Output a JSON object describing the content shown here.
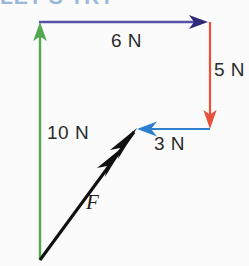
{
  "figure": {
    "title_fragment": "LET'S TRY",
    "kind": "force-vector-diagram",
    "background_color": "#fbfbfb"
  },
  "vectors": [
    {
      "id": "up-10n",
      "label": "10 N",
      "color": "#55a851",
      "direction": "up",
      "magnitude": 10,
      "unit": "N",
      "from": [
        40,
        260
      ],
      "to": [
        40,
        24
      ]
    },
    {
      "id": "right-6n",
      "label": "6 N",
      "color": "#574fa8",
      "direction": "right",
      "magnitude": 6,
      "unit": "N",
      "from": [
        40,
        22
      ],
      "to": [
        208,
        22
      ]
    },
    {
      "id": "down-5n",
      "label": "5 N",
      "color": "#e8503a",
      "direction": "down",
      "magnitude": 5,
      "unit": "N",
      "from": [
        210,
        22
      ],
      "to": [
        210,
        129
      ]
    },
    {
      "id": "left-3n",
      "label": "3 N",
      "color": "#2f7fd0",
      "direction": "left",
      "magnitude": 3,
      "unit": "N",
      "from": [
        210,
        129
      ],
      "to": [
        137,
        129
      ]
    },
    {
      "id": "resultant-f",
      "label": "F",
      "color": "#111111",
      "direction": "up-right",
      "style": "double-headed",
      "from": [
        40,
        260
      ],
      "to": [
        137,
        128
      ]
    }
  ],
  "labels": {
    "six_n": "6 N",
    "five_n": "5 N",
    "ten_n": "10 N",
    "three_n": "3 N",
    "force_f": "F"
  },
  "colors": {
    "green": "#55a851",
    "purple": "#574fa8",
    "red": "#e8503a",
    "blue": "#2f7fd0",
    "black": "#111111",
    "heading_blue": "#4a7fc1"
  }
}
